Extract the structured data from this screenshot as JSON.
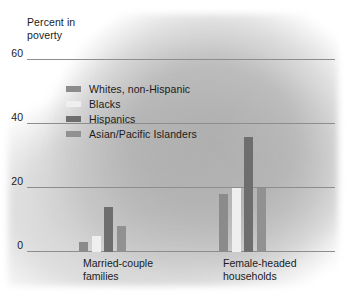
{
  "chart_data": {
    "type": "bar",
    "title": "",
    "subtitle": "",
    "ylabel": "Percent in\npoverty",
    "xlabel": "",
    "ylim": [
      0,
      60
    ],
    "yticks": [
      0,
      20,
      40,
      60
    ],
    "ytick_labels": [
      "0",
      "20",
      "40",
      "60"
    ],
    "grid": true,
    "legend_position": "upper-left-inside",
    "categories": [
      "Married-couple families",
      "Female-headed households"
    ],
    "series": [
      {
        "name": "Whites, non-Hispanic",
        "color": "#8b8b8b",
        "values": [
          3,
          18
        ]
      },
      {
        "name": "Blacks",
        "color": "#efefef",
        "values": [
          5,
          20
        ]
      },
      {
        "name": "Hispanics",
        "color": "#6e6e6e",
        "values": [
          14,
          36
        ]
      },
      {
        "name": "Asian/Pacific Islanders",
        "color": "#919191",
        "values": [
          8,
          20
        ]
      }
    ]
  },
  "axis": {
    "title": "Percent in\npoverty",
    "ticks": [
      {
        "label": "60",
        "value": 60
      },
      {
        "label": "40",
        "value": 40
      },
      {
        "label": "20",
        "value": 20
      },
      {
        "label": "0",
        "value": 0
      }
    ]
  },
  "x_labels": [
    {
      "text": "Married-couple\nfamilies"
    },
    {
      "text": "Female-headed\nhouseholds"
    }
  ],
  "legend": {
    "items": [
      {
        "label": "Whites, non-Hispanic",
        "color": "#8b8b8b"
      },
      {
        "label": "Blacks",
        "color": "#efefef"
      },
      {
        "label": "Hispanics",
        "color": "#6e6e6e"
      },
      {
        "label": "Asian/Pacific Islanders",
        "color": "#919191"
      }
    ]
  },
  "colors": {
    "background": "#ffffff",
    "blob": "#b4b4b4",
    "gridline": "#8d8d8d",
    "text": "#1b1b1b"
  }
}
